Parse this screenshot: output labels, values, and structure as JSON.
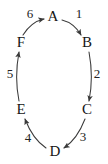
{
  "diagram": {
    "type": "directed-cycle-graph",
    "stroke_color": "#3a3a3a",
    "text_color": "#151515",
    "background_color": "#ffffff",
    "nodes": [
      {
        "id": "A",
        "label": "A",
        "x": 53,
        "y": 17
      },
      {
        "id": "B",
        "label": "B",
        "x": 87,
        "y": 43
      },
      {
        "id": "C",
        "label": "C",
        "x": 87,
        "y": 110
      },
      {
        "id": "D",
        "label": "D",
        "x": 55,
        "y": 152
      },
      {
        "id": "E",
        "label": "E",
        "x": 21,
        "y": 110
      },
      {
        "id": "F",
        "label": "F",
        "x": 21,
        "y": 43
      }
    ],
    "edges": [
      {
        "id": "e1",
        "from": "A",
        "to": "B",
        "label": "1",
        "label_x": 79,
        "label_y": 14
      },
      {
        "id": "e2",
        "from": "B",
        "to": "C",
        "label": "2",
        "label_x": 97,
        "label_y": 74
      },
      {
        "id": "e3",
        "from": "C",
        "to": "D",
        "label": "3",
        "label_x": 83,
        "label_y": 137
      },
      {
        "id": "e4",
        "from": "D",
        "to": "E",
        "label": "4",
        "label_x": 28,
        "label_y": 138
      },
      {
        "id": "e5",
        "from": "E",
        "to": "F",
        "label": "5",
        "label_x": 10,
        "label_y": 74
      },
      {
        "id": "e6",
        "from": "F",
        "to": "A",
        "label": "6",
        "label_x": 30,
        "label_y": 14
      }
    ]
  }
}
